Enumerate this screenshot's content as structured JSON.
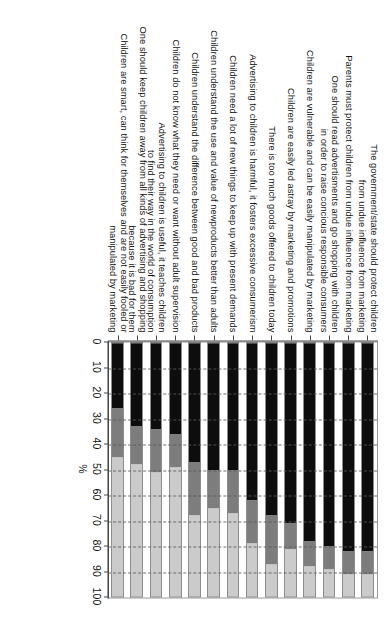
{
  "chart_data": {
    "type": "bar",
    "orientation": "horizontal-stacked",
    "title": "",
    "xlabel": "%",
    "ylabel": "",
    "xlim": [
      0,
      100
    ],
    "grid": true,
    "legend_position": "none",
    "stacked": true,
    "percent": true,
    "tick_labels": [
      "0",
      "10",
      "20",
      "30",
      "40",
      "50",
      "60",
      "70",
      "80",
      "90",
      "100"
    ],
    "tick_values": [
      0,
      10,
      20,
      30,
      40,
      50,
      60,
      70,
      80,
      90,
      100
    ],
    "colors": {
      "agree": "#0d0d0d",
      "neutral": "#7d7d7d",
      "disagree": "#cbcbcb",
      "axis": "#4a4a4a",
      "grid": "#5a5a5a",
      "background": "#ffffff"
    },
    "series": [
      {
        "name": "agree",
        "values": [
          82,
          82,
          80,
          78,
          71,
          68,
          62,
          50,
          50,
          47,
          36,
          34,
          33,
          26
        ]
      },
      {
        "name": "neutral",
        "values": [
          9,
          9,
          9,
          10,
          10,
          19,
          17,
          17,
          15,
          21,
          13,
          17,
          15,
          19
        ]
      },
      {
        "name": "disagree",
        "values": [
          9,
          9,
          11,
          12,
          19,
          13,
          21,
          33,
          35,
          32,
          51,
          49,
          52,
          55
        ]
      }
    ],
    "categories": [
      "The government/state should protect children\nfrom undue influence from marketing",
      "Parents must protect children from undue influence from marketing",
      "One should read advertisments and go shopping with children\nin order to raise concious responsible consumers",
      "Children are vulnerable and can be easily manipulated by marketing",
      "Children are easily led astray by marketing and promotions",
      "There is too much goods offered to children today",
      "Advertising to children is harmful, it fosters excessive consumerism",
      "Children need a lot of new things to keep up with present demands",
      "Children understand the use and value of newproducts better than adults",
      "Children understand the difference between good and bad products",
      "Children do not know what they need or want without adult supervision",
      "Advertising to children is useful, it teaches children\nto find their way in the world of consumption",
      "One should keep children away from all kinds of advertising and shopping\nbecause it is bad for them",
      "Children are smart, can think for themselves and are not easily fooled or\nmanipulated by marketing"
    ]
  }
}
